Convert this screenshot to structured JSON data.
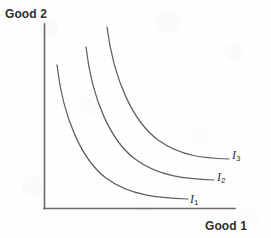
{
  "figure": {
    "type": "indifference-curve-diagram",
    "width": 271,
    "height": 238,
    "background_color": "#fefefe",
    "line_color": "#5f5f5f",
    "text_color": "#2e2e2e"
  },
  "axes": {
    "y_label": "Good 2",
    "x_label": "Good 1",
    "origin": {
      "x": 44,
      "y": 208
    },
    "y_axis_top": {
      "x": 44,
      "y": 24
    },
    "x_axis_right": {
      "x": 235,
      "y": 208
    },
    "ticks": [],
    "grid": false
  },
  "curves": [
    {
      "label": "I",
      "subscript": "1",
      "label_position": {
        "x": 190,
        "y": 192
      },
      "path": "M 57,65 C 63,118 82,160 106,178 C 130,196 160,198 188,199"
    },
    {
      "label": "I",
      "subscript": "2",
      "label_position": {
        "x": 217,
        "y": 170
      },
      "path": "M 86,47 C 92,100 111,141 135,159 C 159,177 188,179 214,180"
    },
    {
      "label": "I",
      "subscript": "3",
      "label_position": {
        "x": 232,
        "y": 148
      },
      "path": "M 107,27 C 114,82 134,122 158,140 C 182,157 205,158 229,159"
    }
  ],
  "chart_data": {
    "type": "line",
    "title": "",
    "xlabel": "Good 1",
    "ylabel": "Good 2",
    "grid": false,
    "legend_position": "inline-right-of-curve",
    "xlim": [
      0,
      1
    ],
    "ylim": [
      0,
      1
    ],
    "series": [
      {
        "name": "I1",
        "utility_level": 1,
        "x": [
          0.068,
          0.13,
          0.22,
          0.325,
          0.45,
          0.58,
          0.755
        ],
        "y": [
          0.777,
          0.57,
          0.395,
          0.275,
          0.19,
          0.14,
          0.05
        ]
      },
      {
        "name": "I2",
        "utility_level": 2,
        "x": [
          0.22,
          0.282,
          0.372,
          0.477,
          0.602,
          0.732,
          0.89
        ],
        "y": [
          0.875,
          0.68,
          0.505,
          0.385,
          0.3,
          0.25,
          0.152
        ]
      },
      {
        "name": "I3",
        "utility_level": 3,
        "x": [
          0.33,
          0.392,
          0.482,
          0.587,
          0.712,
          0.842,
          0.968
        ],
        "y": [
          0.983,
          0.79,
          0.615,
          0.495,
          0.41,
          0.36,
          0.266
        ]
      }
    ],
    "annotations": [
      {
        "text": "I1",
        "x": 0.764,
        "y": 0.08
      },
      {
        "text": "I2",
        "x": 0.906,
        "y": 0.2
      },
      {
        "text": "I3",
        "x": 0.984,
        "y": 0.32
      }
    ]
  }
}
